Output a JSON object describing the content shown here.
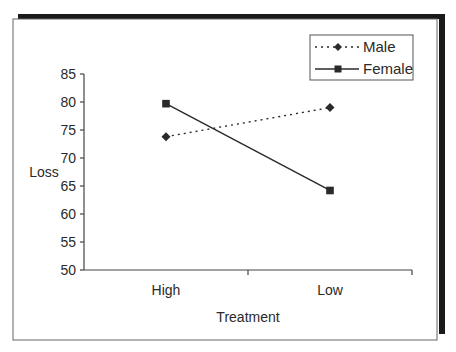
{
  "chart_data": {
    "type": "line",
    "title": "",
    "xlabel": "Treatment",
    "ylabel": "Loss",
    "categories": [
      "High",
      "Low"
    ],
    "series": [
      {
        "name": "Male",
        "values": [
          73.8,
          79.0
        ],
        "line_style": "dotted",
        "marker": "diamond"
      },
      {
        "name": "Female",
        "values": [
          79.7,
          64.2
        ],
        "line_style": "solid",
        "marker": "square"
      }
    ],
    "ylim": [
      50,
      85
    ],
    "yticks": [
      50,
      55,
      60,
      65,
      70,
      75,
      80,
      85
    ],
    "grid": false,
    "legend_position": "top-right"
  },
  "legend": {
    "items": [
      {
        "label": "Male"
      },
      {
        "label": "Female"
      }
    ]
  },
  "colors": {
    "line": "#2a2a2a",
    "frame": "#555555",
    "shadow": "#1a1a1a",
    "background": "#ffffff"
  }
}
